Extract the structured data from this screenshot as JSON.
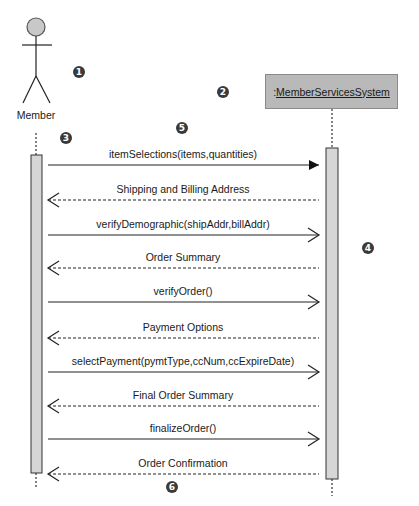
{
  "diagram": {
    "type": "sequence",
    "actor": {
      "label": "Member"
    },
    "object": {
      "prefix": ": ",
      "name": "MemberServicesSystem",
      "fill": "#b9b9b9"
    },
    "badges": [
      {
        "n": "1",
        "x": 79,
        "y": 72
      },
      {
        "n": "2",
        "x": 223,
        "y": 92
      },
      {
        "n": "3",
        "x": 66,
        "y": 138
      },
      {
        "n": "4",
        "x": 368,
        "y": 248
      },
      {
        "n": "5",
        "x": 182,
        "y": 128
      },
      {
        "n": "6",
        "x": 172,
        "y": 487
      }
    ],
    "messages": [
      {
        "label": "itemSelections(items,quantities)",
        "dir": "forward",
        "style": "synchronous",
        "y": 165
      },
      {
        "label": "Shipping and Billing Address",
        "dir": "return",
        "style": "dashed",
        "y": 200
      },
      {
        "label": "verifyDemographic(shipAddr,billAddr)",
        "dir": "forward",
        "style": "open",
        "y": 235
      },
      {
        "label": "Order Summary",
        "dir": "return",
        "style": "dashed",
        "y": 268
      },
      {
        "label": "verifyOrder()",
        "dir": "forward",
        "style": "open",
        "y": 302
      },
      {
        "label": "Payment Options",
        "dir": "return",
        "style": "dashed",
        "y": 338
      },
      {
        "label": "selectPayment(pymtType,ccNum,ccExpireDate)",
        "dir": "forward",
        "style": "open",
        "y": 372
      },
      {
        "label": "Final Order Summary",
        "dir": "return",
        "style": "dashed",
        "y": 406
      },
      {
        "label": "finalizeOrder()",
        "dir": "forward",
        "style": "open",
        "y": 439
      },
      {
        "label": "Order Confirmation",
        "dir": "return",
        "style": "dashed",
        "y": 474
      }
    ]
  }
}
